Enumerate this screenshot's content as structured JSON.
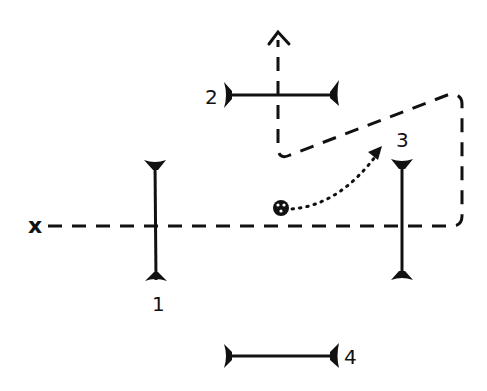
{
  "diagram": {
    "axis_label": "x",
    "colors": {
      "ink": "#111111",
      "background": "#ffffff"
    },
    "mirrors": [
      {
        "id": "1",
        "label": "1",
        "orientation": "vertical"
      },
      {
        "id": "2",
        "label": "2",
        "orientation": "horizontal"
      },
      {
        "id": "3",
        "label": "3",
        "orientation": "vertical"
      },
      {
        "id": "4",
        "label": "4",
        "orientation": "horizontal"
      }
    ],
    "source": {
      "symbol": "source-circle"
    },
    "paths": [
      {
        "type": "dashed",
        "description": "optical beam path along x axis, folded back and up"
      },
      {
        "type": "dotted",
        "description": "curved arrow from source toward mirror 3"
      }
    ]
  }
}
